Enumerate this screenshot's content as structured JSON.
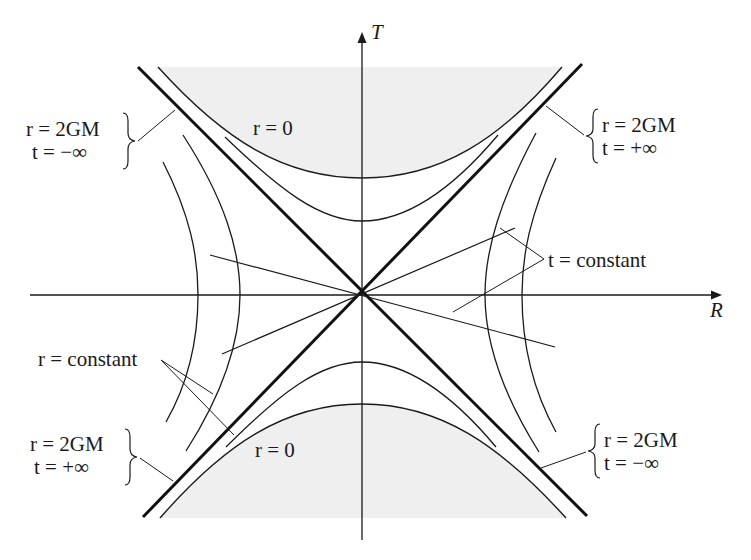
{
  "figure": {
    "axes": {
      "horizontal_label": "R",
      "vertical_label": "T"
    },
    "regions": {
      "singularity_top": "r = 0",
      "singularity_bottom": "r = 0"
    },
    "annotations": {
      "top_left": {
        "line1": "r = 2GM",
        "line2": "t = −∞"
      },
      "top_right": {
        "line1": "r = 2GM",
        "line2": "t = +∞"
      },
      "bottom_left": {
        "line1": "r = 2GM",
        "line2": "t = +∞"
      },
      "bottom_right": {
        "line1": "r = 2GM",
        "line2": "t = −∞"
      },
      "r_constant": "r = constant",
      "t_constant": "t = constant"
    },
    "colors": {
      "ink": "#1a1a1a",
      "shade": "#efefef",
      "background": "#ffffff"
    }
  }
}
